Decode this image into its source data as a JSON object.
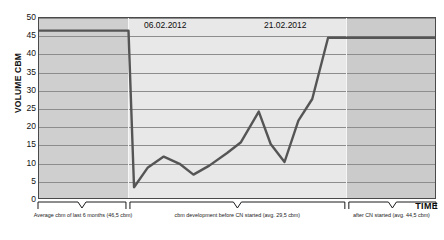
{
  "chart_data": {
    "type": "line",
    "title": "",
    "xlabel": "TIME",
    "ylabel": "VOLUME CBM",
    "ylim": [
      0,
      50
    ],
    "ytick_step": 5,
    "yticks": [
      50,
      45,
      40,
      35,
      30,
      25,
      20,
      15,
      10,
      5,
      0
    ],
    "grid": true,
    "legend": "none",
    "series": [
      {
        "name": "Volume cbm",
        "x": [
          0,
          20.5,
          22.6,
          24.0,
          27.5,
          31.5,
          35.5,
          39.0,
          43.0,
          47.5,
          51.0,
          55.5,
          58.5,
          62.0,
          65.5,
          69.0,
          73.0,
          77.6,
          100
        ],
        "values": [
          46.5,
          46.5,
          46.5,
          3.0,
          8.5,
          11.5,
          9.5,
          6.5,
          9.0,
          12.5,
          15.5,
          24.0,
          15.0,
          10.0,
          21.5,
          27.5,
          44.5,
          44.5,
          44.5
        ]
      }
    ],
    "annotations": [
      {
        "name": "date-1",
        "text": "06.02.2012",
        "x_pct": 22.6
      },
      {
        "name": "date-2",
        "text": "21.02.2012",
        "x_pct": 55.0
      }
    ],
    "regions": [
      {
        "name": "average-before",
        "label": "Average cbm of last 6 months (46,5 cbm)",
        "average": 46.5,
        "x_start_pct": 0.0,
        "x_end_pct": 22.6
      },
      {
        "name": "during-cn",
        "label": "cbm development before CN started (avg. 29,5 cbm)",
        "average": 29.5,
        "x_start_pct": 22.6,
        "x_end_pct": 77.6
      },
      {
        "name": "after-cn",
        "label": "after CN started (avg. 44,5 cbm)",
        "average": 44.5,
        "x_start_pct": 77.6,
        "x_end_pct": 100.0
      }
    ],
    "colors": {
      "line": "#555555",
      "band_left": "#cfcfcf",
      "band_mid": "#e8e8e8",
      "band_right": "#cbcbcb",
      "grid": "#8d8d8d",
      "frame": "#4a4a4a",
      "text": "#121212"
    }
  },
  "axes": {
    "y_title": "VOLUME CBM",
    "x_title": "TIME"
  },
  "dates": {
    "first": "06.02.2012",
    "second": "21.02.2012"
  },
  "captions": {
    "left": "Average cbm of last 6 months (46,5 cbm)",
    "middle": "cbm development before CN started (avg. 29,5 cbm)",
    "right": "after CN started (avg. 44,5 cbm)"
  }
}
